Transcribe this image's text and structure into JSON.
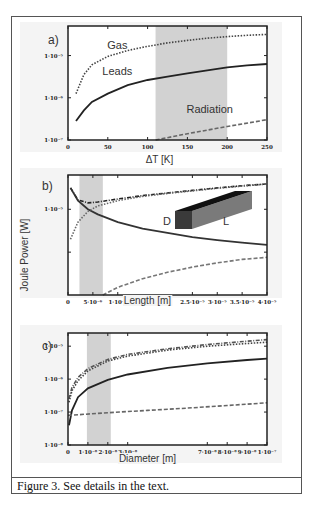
{
  "header": {
    "cutoff_text": ""
  },
  "caption": "Figure 3. See details in the text.",
  "chart_data": [
    {
      "type": "line",
      "panel_label": "a)",
      "xlabel": "ΔT [K]",
      "ylabel": "",
      "yscale": "log",
      "xlim": [
        0,
        250
      ],
      "ylim_exp": [
        -7,
        -4.3
      ],
      "xticks": [
        0,
        50,
        100,
        150,
        200,
        250
      ],
      "xtick_labels": [
        "0",
        "50",
        "100",
        "150",
        "200",
        "250"
      ],
      "yticks_exp": [
        -7,
        -6,
        -5
      ],
      "ytick_labels": [
        "1·10⁻⁷",
        "1·10⁻⁶",
        "1·10⁻⁵"
      ],
      "shaded_region": [
        110,
        200
      ],
      "annotations": [
        {
          "text": "Gas",
          "x": 62,
          "y_exp": -4.85
        },
        {
          "text": "Leads",
          "x": 62,
          "y_exp": -5.45
        },
        {
          "text": "Radiation",
          "x": 178,
          "y_exp": -6.35
        }
      ],
      "series": [
        {
          "name": "Gas",
          "style": "dotted",
          "color": "#444444",
          "x": [
            10,
            20,
            30,
            50,
            75,
            100,
            125,
            150,
            175,
            200,
            225,
            250
          ],
          "y_exp": [
            -5.9,
            -5.45,
            -5.22,
            -5.02,
            -4.88,
            -4.78,
            -4.7,
            -4.64,
            -4.59,
            -4.55,
            -4.52,
            -4.5
          ]
        },
        {
          "name": "Leads",
          "style": "solid",
          "color": "#222222",
          "x": [
            10,
            20,
            30,
            50,
            75,
            100,
            125,
            150,
            175,
            200,
            225,
            250
          ],
          "y_exp": [
            -6.55,
            -6.3,
            -6.1,
            -5.9,
            -5.7,
            -5.58,
            -5.5,
            -5.42,
            -5.35,
            -5.28,
            -5.23,
            -5.2
          ]
        },
        {
          "name": "Radiation",
          "style": "dashed",
          "color": "#666666",
          "x": [
            110,
            150,
            200,
            250
          ],
          "y_exp": [
            -7.0,
            -6.85,
            -6.68,
            -6.52
          ]
        }
      ]
    },
    {
      "type": "line",
      "panel_label": "b)",
      "xlabel": "Length [m]",
      "ylabel": "Joule Power [W]",
      "yscale": "log",
      "xlim": [
        0,
        4e-05
      ],
      "ylim_exp": [
        -7,
        -4.2
      ],
      "xticks": [
        0,
        5e-06,
        1e-05,
        2.5e-05,
        3e-05,
        3.5e-05,
        4e-05
      ],
      "xtick_labels": [
        "0",
        "5·10⁻⁶",
        "1·10⁻⁵",
        "2.5·10⁻⁵",
        "3·10⁻⁵",
        "3.5·10⁻⁵",
        "4·10⁻⁵"
      ],
      "yticks_exp": [
        -6,
        -5
      ],
      "ytick_labels": [
        "",
        "1·10⁻⁵"
      ],
      "shaded_region": [
        2.3e-06,
        7e-06
      ],
      "inset": {
        "label_d": "D",
        "label_l": "L"
      },
      "series": [
        {
          "name": "Total",
          "style": "dashdot",
          "color": "#222222",
          "x": [
            5e-07,
            2e-06,
            4e-06,
            6e-06,
            1e-05,
            1.5e-05,
            2e-05,
            2.5e-05,
            3e-05,
            3.5e-05,
            4e-05
          ],
          "y_exp": [
            -4.5,
            -4.78,
            -4.85,
            -4.83,
            -4.76,
            -4.68,
            -4.62,
            -4.56,
            -4.5,
            -4.45,
            -4.41
          ]
        },
        {
          "name": "Leads",
          "style": "solid",
          "color": "#333333",
          "x": [
            5e-07,
            2e-06,
            4e-06,
            6e-06,
            1e-05,
            1.5e-05,
            2e-05,
            2.5e-05,
            3e-05,
            3.5e-05,
            4e-05
          ],
          "y_exp": [
            -4.5,
            -4.8,
            -5.0,
            -5.12,
            -5.3,
            -5.45,
            -5.55,
            -5.65,
            -5.72,
            -5.78,
            -5.83
          ]
        },
        {
          "name": "Gas",
          "style": "dotted",
          "color": "#666666",
          "x": [
            5e-07,
            2e-06,
            4e-06,
            6e-06,
            1e-05,
            1.5e-05,
            2e-05,
            2.5e-05,
            3e-05,
            3.5e-05,
            4e-05
          ],
          "y_exp": [
            -5.7,
            -5.3,
            -5.05,
            -4.92,
            -4.8,
            -4.7,
            -4.63,
            -4.57,
            -4.51,
            -4.46,
            -4.41
          ]
        },
        {
          "name": "Radiation",
          "style": "dashed",
          "color": "#777777",
          "x": [
            7e-06,
            1e-05,
            1.5e-05,
            2e-05,
            2.5e-05,
            3e-05,
            3.5e-05,
            4e-05
          ],
          "y_exp": [
            -7.0,
            -6.82,
            -6.62,
            -6.47,
            -6.35,
            -6.25,
            -6.17,
            -6.12
          ]
        }
      ]
    },
    {
      "type": "line",
      "panel_label": "c)",
      "xlabel": "Diameter [m]",
      "ylabel": "",
      "yscale": "log",
      "xlim": [
        0,
        1e-07
      ],
      "ylim_exp": [
        -8,
        -4.6
      ],
      "xticks": [
        0,
        1e-08,
        2e-08,
        3e-08,
        7e-08,
        8e-08,
        9e-08,
        1e-07
      ],
      "xtick_labels": [
        "0",
        "1·10⁻⁸",
        "2·10⁻⁸",
        "3·10⁻⁸",
        "7·10⁻⁸",
        "8·10⁻⁸",
        "9·10⁻⁸",
        "1·10⁻⁷"
      ],
      "yticks_exp": [
        -8,
        -7,
        -6,
        -5
      ],
      "ytick_labels": [
        "1·10⁻⁸",
        "1·10⁻⁷",
        "1·10⁻⁶",
        "1·10⁻⁵"
      ],
      "shaded_region": [
        9.5e-09,
        2.15e-08
      ],
      "series": [
        {
          "name": "Total",
          "style": "dashdot",
          "color": "#555555",
          "x": [
            5e-10,
            2e-09,
            5e-09,
            1e-08,
            2e-08,
            3e-08,
            5e-08,
            7e-08,
            9e-08,
            1e-07
          ],
          "y_exp": [
            -6.6,
            -6.25,
            -5.95,
            -5.68,
            -5.4,
            -5.25,
            -5.08,
            -4.95,
            -4.85,
            -4.8
          ]
        },
        {
          "name": "Gas",
          "style": "dotted",
          "color": "#444444",
          "x": [
            5e-10,
            2e-09,
            5e-09,
            1e-08,
            2e-08,
            3e-08,
            5e-08,
            7e-08,
            9e-08,
            1e-07
          ],
          "y_exp": [
            -6.7,
            -6.35,
            -6.05,
            -5.75,
            -5.45,
            -5.3,
            -5.12,
            -5.0,
            -4.92,
            -4.88
          ]
        },
        {
          "name": "Leads",
          "style": "solid",
          "color": "#222222",
          "x": [
            5e-10,
            2e-09,
            5e-09,
            1e-08,
            2e-08,
            3e-08,
            5e-08,
            7e-08,
            9e-08,
            1e-07
          ],
          "y_exp": [
            -7.4,
            -6.95,
            -6.55,
            -6.28,
            -6.02,
            -5.86,
            -5.66,
            -5.52,
            -5.42,
            -5.38
          ]
        },
        {
          "name": "Radiation",
          "style": "dashed",
          "color": "#666666",
          "x": [
            0,
            2e-08,
            4e-08,
            6e-08,
            8e-08,
            1e-07
          ],
          "y_exp": [
            -7.1,
            -7.02,
            -6.95,
            -6.88,
            -6.8,
            -6.72
          ]
        }
      ]
    }
  ]
}
